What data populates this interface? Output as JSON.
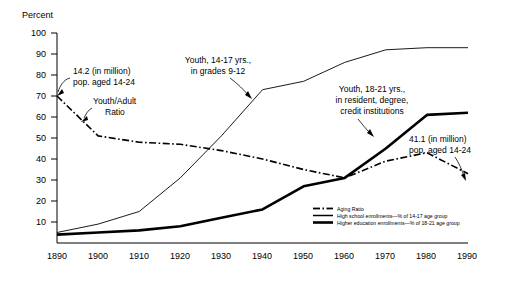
{
  "chart_data": {
    "type": "line",
    "title": "",
    "xlabel": "",
    "ylabel": "Percent",
    "x": [
      1890,
      1900,
      1910,
      1920,
      1930,
      1940,
      1950,
      1960,
      1970,
      1980,
      1990
    ],
    "xlim": [
      1890,
      1990
    ],
    "ylim": [
      0,
      100
    ],
    "yticks": [
      10,
      20,
      30,
      40,
      50,
      60,
      70,
      80,
      90,
      100
    ],
    "xticks": [
      1890,
      1900,
      1910,
      1920,
      1930,
      1940,
      1950,
      1960,
      1970,
      1980,
      1990
    ],
    "grid": false,
    "legend_position": "inside-bottom-right",
    "series": [
      {
        "name": "Aging Ratio",
        "style": "dash-dot",
        "values": [
          70,
          51,
          48,
          47,
          44,
          40,
          35,
          31,
          39,
          43,
          33
        ]
      },
      {
        "name": "High school enrollments—% of 14-17 age group",
        "style": "thin-solid",
        "values": [
          5,
          9,
          15,
          31,
          51,
          73,
          77,
          86,
          92,
          93,
          93
        ]
      },
      {
        "name": "Higher education enrollments—% of 18-21 age group",
        "style": "thick-solid",
        "values": [
          4,
          5,
          6,
          8,
          12,
          16,
          27,
          31,
          45,
          61,
          62
        ]
      }
    ],
    "annotations": [
      {
        "id": "pop-1890",
        "text_lines": [
          "14.2 (in million)",
          "pop. aged 14-24"
        ],
        "points_to": {
          "x": 1890,
          "y": 70
        }
      },
      {
        "id": "youth-adult-ratio",
        "text_lines": [
          "Youth/Adult",
          "Ratio"
        ],
        "points_to": {
          "x": 1900,
          "y": 51
        }
      },
      {
        "id": "high-school",
        "text_lines": [
          "Youth, 14-17 yrs.,",
          "in grades 9-12"
        ],
        "points_to": {
          "x": 1940,
          "y": 73
        }
      },
      {
        "id": "higher-education",
        "text_lines": [
          "Youth, 18-21 yrs.,",
          "in resident, degree,",
          "credit institutions"
        ],
        "points_to": {
          "x": 1968,
          "y": 43
        }
      },
      {
        "id": "pop-1990",
        "text_lines": [
          "41.1 (in million)",
          "pop. aged 14-24"
        ],
        "points_to": {
          "x": 1990,
          "y": 33
        }
      }
    ]
  },
  "axis": {
    "y_title": "Percent",
    "y_labels": [
      "100",
      "90",
      "80",
      "70",
      "60",
      "50",
      "40",
      "30",
      "20",
      "10"
    ],
    "x_labels": [
      "1890",
      "1900",
      "1910",
      "1920",
      "1930",
      "1940",
      "1950",
      "1960",
      "1970",
      "1980",
      "1990"
    ]
  },
  "annotations": {
    "pop1890_line1": "14.2 (in million)",
    "pop1890_line2": "pop. aged 14-24",
    "ratio_line1": "Youth/Adult",
    "ratio_line2": "Ratio",
    "hs_line1": "Youth, 14-17 yrs.,",
    "hs_line2": "in grades 9-12",
    "he_line1": "Youth, 18-21 yrs.,",
    "he_line2": "in resident, degree,",
    "he_line3": "credit institutions",
    "pop1990_line1": "41.1 (in million)",
    "pop1990_line2": "pop. aged 14-24"
  },
  "legend": {
    "items": [
      {
        "label": "Aging Ratio",
        "style": "dash-dot"
      },
      {
        "label": "High school enrollments—% of 14-17 age group",
        "style": "thin-solid"
      },
      {
        "label": "Higher education enrollments—% of 18-21 age group",
        "style": "thick-solid"
      }
    ]
  }
}
